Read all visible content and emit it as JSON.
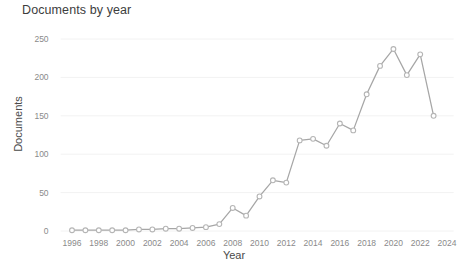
{
  "chart_data": {
    "type": "line",
    "title": "Documents by year",
    "xlabel": "Year",
    "ylabel": "Documents",
    "grid": true,
    "legend": false,
    "xlim": [
      1995,
      2024.5
    ],
    "ylim": [
      0,
      262
    ],
    "xticks": [
      1996,
      1998,
      2000,
      2002,
      2004,
      2006,
      2008,
      2010,
      2012,
      2014,
      2016,
      2018,
      2020,
      2022,
      2024
    ],
    "yticks": [
      0,
      50,
      100,
      150,
      200,
      250
    ],
    "x": [
      1996,
      1997,
      1998,
      1999,
      2000,
      2001,
      2002,
      2003,
      2004,
      2005,
      2006,
      2007,
      2008,
      2009,
      2010,
      2011,
      2012,
      2013,
      2014,
      2015,
      2016,
      2017,
      2018,
      2019,
      2020,
      2021,
      2022,
      2023
    ],
    "values": [
      1,
      1,
      1,
      1,
      1,
      2,
      2,
      3,
      3,
      4,
      5,
      9,
      30,
      20,
      45,
      66,
      63,
      118,
      120,
      111,
      140,
      131,
      178,
      215,
      237,
      203,
      230,
      150
    ],
    "series": [
      {
        "name": "Documents",
        "values": [
          1,
          1,
          1,
          1,
          1,
          2,
          2,
          3,
          3,
          4,
          5,
          9,
          30,
          20,
          45,
          66,
          63,
          118,
          120,
          111,
          140,
          131,
          178,
          215,
          237,
          203,
          230,
          150
        ]
      }
    ],
    "line_color": "#a6a6a6",
    "marker_color": "#b5b5b5",
    "grid_color": "#f2f2f2",
    "background_color": "#ffffff",
    "text_color": "#8a8a8a"
  }
}
